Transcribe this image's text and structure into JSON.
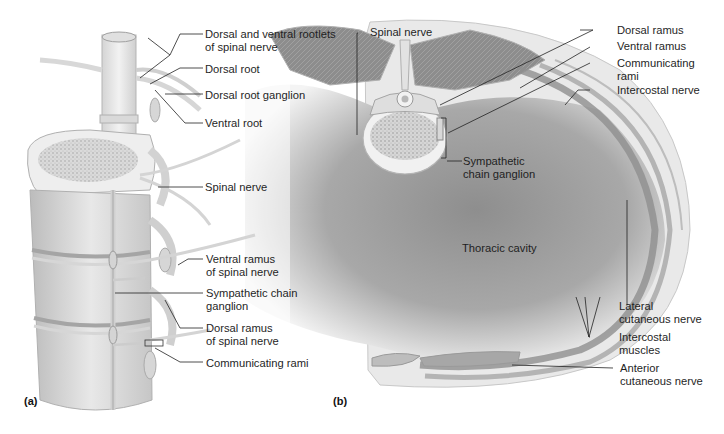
{
  "figure": {
    "panels": [
      {
        "tag": "(a)",
        "view": "posterolateral view of thoracic vertebral column with spinal nerves and sympathetic trunk",
        "labels": [
          {
            "line1": "Dorsal and ventral rootlets",
            "line2": "of spinal nerve"
          },
          {
            "line1": "Dorsal root"
          },
          {
            "line1": "Dorsal root ganglion"
          },
          {
            "line1": "Ventral root"
          },
          {
            "line1": "Spinal nerve"
          },
          {
            "line1": "Ventral ramus",
            "line2": "of spinal nerve"
          },
          {
            "line1": "Sympathetic chain",
            "line2": "ganglion"
          },
          {
            "line1": "Dorsal ramus",
            "line2": "of spinal nerve"
          },
          {
            "line1": "Communicating rami"
          }
        ]
      },
      {
        "tag": "(b)",
        "view": "transverse section of thorax",
        "labels": [
          {
            "line1": "Spinal nerve"
          },
          {
            "line1": "Dorsal ramus"
          },
          {
            "line1": "Ventral ramus"
          },
          {
            "line1": "Communicating",
            "line2": "rami"
          },
          {
            "line1": "Intercostal nerve"
          },
          {
            "line1": "Sympathetic",
            "line2": "chain ganglion"
          },
          {
            "line1": "Thoracic cavity"
          },
          {
            "line1": "Lateral",
            "line2": "cutaneous nerve"
          },
          {
            "line1": "Intercostal",
            "line2": "muscles"
          },
          {
            "line1": "Anterior",
            "line2": "cutaneous nerve"
          }
        ]
      }
    ],
    "colors": {
      "bone": "#e6e6e6",
      "bone_shade": "#bdbdbd",
      "muscle": "#8a8a8a",
      "cavity_dark": "#9a9a9a",
      "cavity_light": "#f2f2f2",
      "nerve": "#d8d8d8",
      "leader": "#222222"
    }
  }
}
